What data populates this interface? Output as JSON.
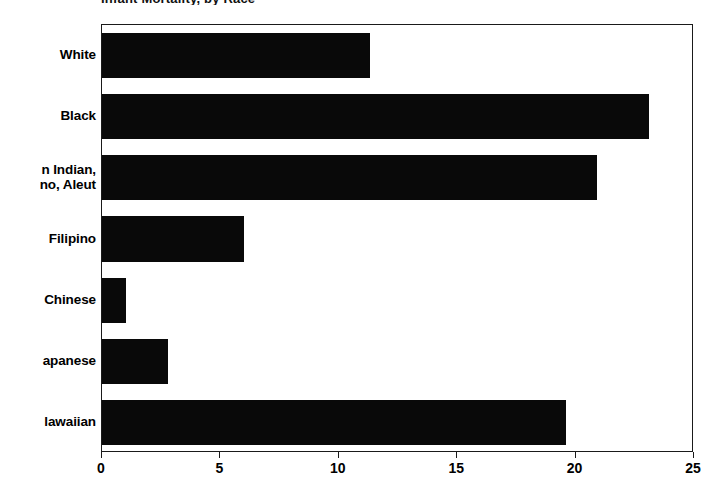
{
  "chart_data": {
    "type": "bar",
    "orientation": "horizontal",
    "title": "Infant Mortality, by Race",
    "xlabel": "",
    "ylabel": "",
    "xlim": [
      0,
      25
    ],
    "xticks": [
      0,
      5,
      10,
      15,
      20,
      25
    ],
    "xtick_labels": [
      "0",
      "5",
      "10",
      "15",
      "20",
      "25"
    ],
    "grid": false,
    "legend": false,
    "bar_color": "#090909",
    "frame_color": "#1a1a1a",
    "categories": [
      "White",
      "Black",
      "n Indian,\nno, Aleut",
      "Filipino",
      "Chinese",
      "apanese",
      "lawaiian"
    ],
    "values": [
      11.3,
      23.1,
      20.9,
      6.0,
      1.0,
      2.8,
      19.6
    ]
  },
  "axis": {
    "x_min_label": "0",
    "x_max_label": "25"
  }
}
